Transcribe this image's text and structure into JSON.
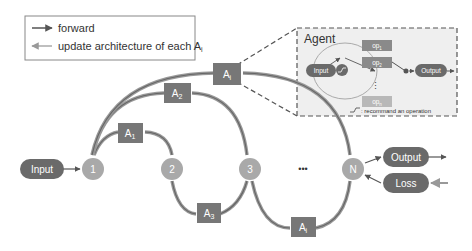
{
  "legend": {
    "forward": "forward",
    "update": "update architecture of each A",
    "update_sub": "i"
  },
  "nodes": {
    "input": "Input",
    "n1": "1",
    "n2": "2",
    "n3": "3",
    "dots": "•••",
    "nN": "N",
    "output": "Output",
    "loss": "Loss"
  },
  "agents": {
    "a1": {
      "base": "A",
      "sub": "1"
    },
    "a2": {
      "base": "A",
      "sub": "2"
    },
    "a3": {
      "base": "A",
      "sub": "3"
    },
    "ai_top": {
      "base": "A",
      "sub": "i"
    },
    "ai_bottom": {
      "base": "A",
      "sub": "i"
    }
  },
  "agent_panel": {
    "title": "Agent",
    "input": "Input",
    "output": "Output",
    "op1": {
      "base": "op",
      "sub": "1"
    },
    "op2": {
      "base": "op",
      "sub": "2"
    },
    "opn": {
      "base": "op",
      "sub": "n"
    },
    "vdots": "⋮",
    "note": ": recommand an operation"
  },
  "colors": {
    "dark_node": "#6a6a6a",
    "agent_box": "#777777",
    "circle_node": "#a9a9a9",
    "op_box": "#8a8a8a",
    "op_light": "#b8b8b8",
    "panel_bg": "#efefef",
    "line": "#666666",
    "update_line": "#b0b0b0"
  }
}
